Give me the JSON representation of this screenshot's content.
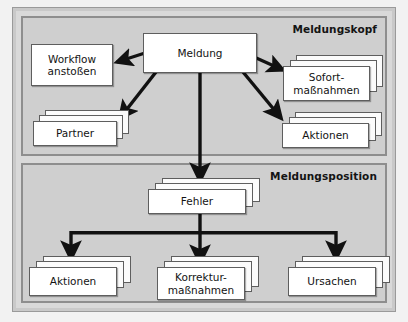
{
  "diagram": {
    "background_color": "#cfcfcf",
    "frame_color": "#8e8e8e",
    "node_fill": "#ffffff",
    "node_border": "#5e5e5e",
    "arrow_color": "#111111"
  },
  "sections": [
    {
      "id": "meldungskopf",
      "label": "Meldungskopf"
    },
    {
      "id": "meldungsposition",
      "label": "Meldungsposition"
    }
  ],
  "nodes": [
    {
      "id": "meldung",
      "label": "Meldung",
      "stack": 1,
      "section": "meldungskopf"
    },
    {
      "id": "workflow",
      "label": "Workflow\nanstoßen",
      "stack": 1,
      "section": "meldungskopf"
    },
    {
      "id": "partner",
      "label": "Partner",
      "stack": 3,
      "section": "meldungskopf"
    },
    {
      "id": "sofortmassnahmen",
      "label": "Sofort-\nmaßnahmen",
      "stack": 3,
      "section": "meldungskopf"
    },
    {
      "id": "aktionen-kopf",
      "label": "Aktionen",
      "stack": 3,
      "section": "meldungskopf"
    },
    {
      "id": "fehler",
      "label": "Fehler",
      "stack": 3,
      "section": "meldungsposition"
    },
    {
      "id": "aktionen-pos",
      "label": "Aktionen",
      "stack": 3,
      "section": "meldungsposition"
    },
    {
      "id": "korrektur",
      "label": "Korrektur-\nmaßnahmen",
      "stack": 3,
      "section": "meldungsposition"
    },
    {
      "id": "ursachen",
      "label": "Ursachen",
      "stack": 3,
      "section": "meldungsposition"
    }
  ],
  "edges": [
    {
      "from": "meldung",
      "to": "workflow"
    },
    {
      "from": "meldung",
      "to": "partner"
    },
    {
      "from": "meldung",
      "to": "sofortmassnahmen"
    },
    {
      "from": "meldung",
      "to": "aktionen-kopf"
    },
    {
      "from": "meldung",
      "to": "fehler"
    },
    {
      "from": "fehler",
      "to": "aktionen-pos"
    },
    {
      "from": "fehler",
      "to": "korrektur"
    },
    {
      "from": "fehler",
      "to": "ursachen"
    }
  ]
}
